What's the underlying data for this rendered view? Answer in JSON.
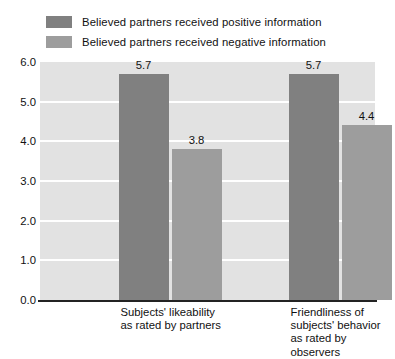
{
  "chart_data": {
    "type": "bar",
    "title": "",
    "subtitle": "",
    "xlabel": "",
    "ylabel": "",
    "ylim": [
      0.0,
      6.0
    ],
    "ytick_labels": [
      "0.0",
      "1.0",
      "2.0",
      "3.0",
      "4.0",
      "5.0",
      "6.0"
    ],
    "ytick_values": [
      0.0,
      1.0,
      2.0,
      3.0,
      4.0,
      5.0,
      6.0
    ],
    "grid": "horizontal-white-gridlines",
    "legend_position": "top-left",
    "categories": [
      "Subjects' likeability\nas rated by partners",
      "Friendliness of\nsubjects' behavior\nas rated by observers"
    ],
    "series": [
      {
        "name": "Believed partners received positive information",
        "values": [
          5.7,
          5.7
        ],
        "value_labels": [
          "5.7",
          "5.7"
        ],
        "color": "#808080"
      },
      {
        "name": "Believed partners received negative information",
        "values": [
          3.8,
          4.4
        ],
        "value_labels": [
          "3.8",
          "4.4"
        ],
        "color": "#9d9d9d"
      }
    ],
    "plot_background": "#e2e2e2",
    "gridline_color": "#ffffff",
    "axis_color": "#232323"
  }
}
